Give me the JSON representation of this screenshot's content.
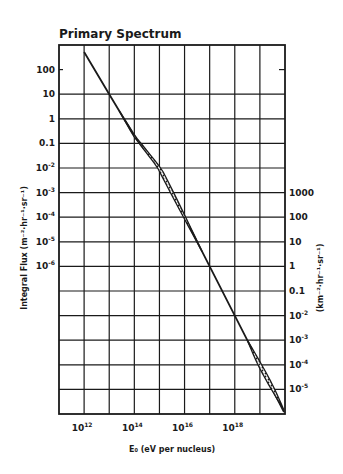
{
  "chart_data": {
    "type": "line",
    "title": "Primary Spectrum",
    "xlabel": "E₀ (eV per nucleus)",
    "ylabel": "Integral Flux (m⁻²·hr⁻¹·sr⁻¹)",
    "ylabel_right": "(km⁻²·hr⁻¹·sr⁻¹)",
    "x_scale": "log",
    "y_scale": "log",
    "xlim": [
      100000000000.0,
      1e+20
    ],
    "ylim_left": [
      0.01,
      1000.0
    ],
    "x_ticks": [
      {
        "label": "10",
        "exp": "12",
        "value": 1000000000000.0
      },
      {
        "label": "10",
        "exp": "14",
        "value": 100000000000000.0
      },
      {
        "label": "10",
        "exp": "16",
        "value": 1e+16
      },
      {
        "label": "10",
        "exp": "18",
        "value": 1e+18
      }
    ],
    "y_ticks_left": [
      {
        "label": "100",
        "exp": ""
      },
      {
        "label": "10",
        "exp": ""
      },
      {
        "label": "1",
        "exp": ""
      },
      {
        "label": "0.1",
        "exp": ""
      },
      {
        "label": "10",
        "exp": "-2"
      },
      {
        "label": "10",
        "exp": "-3"
      },
      {
        "label": "10",
        "exp": "-4"
      },
      {
        "label": "10",
        "exp": "-5"
      },
      {
        "label": "10",
        "exp": "-6"
      }
    ],
    "y_ticks_right": [
      {
        "label": "1000",
        "exp": ""
      },
      {
        "label": "100",
        "exp": ""
      },
      {
        "label": "10",
        "exp": ""
      },
      {
        "label": "1",
        "exp": ""
      },
      {
        "label": "0.1",
        "exp": ""
      },
      {
        "label": "10",
        "exp": "-2"
      },
      {
        "label": "10",
        "exp": "-3"
      },
      {
        "label": "10",
        "exp": "-4"
      },
      {
        "label": "10",
        "exp": "-5"
      }
    ],
    "grid": true,
    "series": [
      {
        "name": "Integral flux",
        "x": [
          1000000000000.0,
          10000000000000.0,
          100000000000000.0,
          1000000000000000.0,
          1e+16,
          1e+17,
          1e+18,
          1e+19,
          1e+20
        ],
        "y_m2": [
          500,
          10,
          0.2,
          0.01,
          0.0001,
          1e-06,
          1e-08,
          1e-10,
          1e-12
        ],
        "y_km2": [
          500000000.0,
          10000000.0,
          200000.0,
          10000.0,
          100,
          1,
          0.01,
          0.0001,
          1e-06
        ]
      }
    ],
    "annotations": [
      "hatched uncertainty band between ~1e13.5–1e16.5 eV and ~1e18.5–1e20 eV"
    ]
  }
}
